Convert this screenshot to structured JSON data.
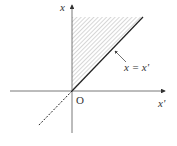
{
  "diagram": {
    "title": "",
    "axes": {
      "vertical_label": "x",
      "horizontal_label": "x'",
      "origin_label": "O"
    },
    "line_label": "x = x'",
    "colors": {
      "axis": "#555555",
      "line": "#222222",
      "hatch": "#9a9a9a",
      "text": "#333333"
    }
  }
}
